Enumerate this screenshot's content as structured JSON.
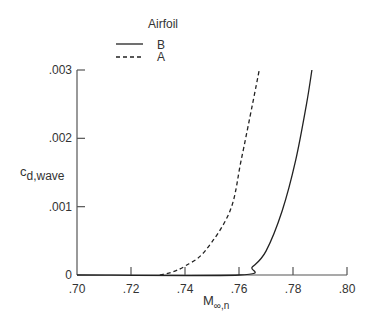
{
  "chart_data": {
    "type": "line",
    "title": "",
    "xlabel": "M",
    "xlabel_sub": "∞,n",
    "ylabel": "c",
    "ylabel_sub": "d,wave",
    "xlim": [
      0.7,
      0.8
    ],
    "ylim": [
      0,
      0.003
    ],
    "xticks": [
      0.7,
      0.72,
      0.74,
      0.76,
      0.78,
      0.8
    ],
    "xtick_labels": [
      ".70",
      ".72",
      ".74",
      ".76",
      ".78",
      ".80"
    ],
    "yticks": [
      0,
      0.001,
      0.002,
      0.003
    ],
    "ytick_labels": [
      "0",
      ".001",
      ".002",
      ".003"
    ],
    "grid": false,
    "legend": {
      "title": "Airfoil",
      "placement": "top-center",
      "entries": [
        {
          "label": "B",
          "style": "solid"
        },
        {
          "label": "A",
          "style": "dashed"
        }
      ]
    },
    "series": [
      {
        "name": "B",
        "style": "solid",
        "x": [
          0.7,
          0.76,
          0.765,
          0.77,
          0.776,
          0.781,
          0.785,
          0.787
        ],
        "y": [
          0,
          0,
          0.00012,
          0.00035,
          0.00094,
          0.00168,
          0.0025,
          0.003
        ]
      },
      {
        "name": "A",
        "style": "dashed",
        "x": [
          0.7307,
          0.735,
          0.74,
          0.7474,
          0.7567,
          0.7608,
          0.765,
          0.7675
        ],
        "y": [
          0,
          4e-05,
          0.00013,
          0.00035,
          0.00094,
          0.00168,
          0.0025,
          0.003
        ]
      }
    ]
  }
}
